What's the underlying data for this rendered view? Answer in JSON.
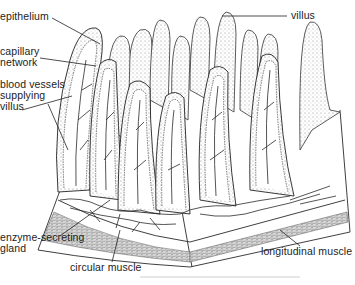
{
  "diagram": {
    "labels": {
      "epithelium": "epithelium",
      "capillary_network": "capillary\nnetwork",
      "blood_vessels": "blood vessels\nsupplying\nvillus",
      "villus": "villus",
      "enzyme_gland": "enzyme-secreting\ngland",
      "circular_muscle": "circular muscle",
      "longitudinal_muscle": "longitudinal muscle"
    },
    "colors": {
      "ink": "#1c1c1c",
      "stipple": "#9a9a9a",
      "muscle": "#b8b8b8",
      "background": "#ffffff"
    }
  }
}
